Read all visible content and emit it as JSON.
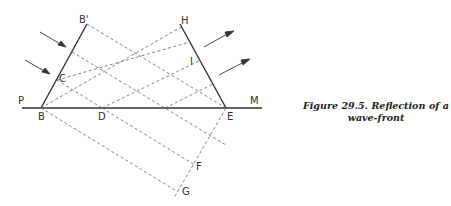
{
  "figure": {
    "caption_line1": "Figure 29.5. Reflection of a",
    "caption_line2": "wave-front"
  },
  "labels": {
    "P": "P",
    "M": "M",
    "B": "B",
    "B_prime": "B'",
    "C": "C",
    "D": "D",
    "E": "E",
    "H": "H",
    "I": "I",
    "F": "F",
    "G": "G"
  },
  "colors": {
    "line": "#333333",
    "dashed": "#666666"
  }
}
